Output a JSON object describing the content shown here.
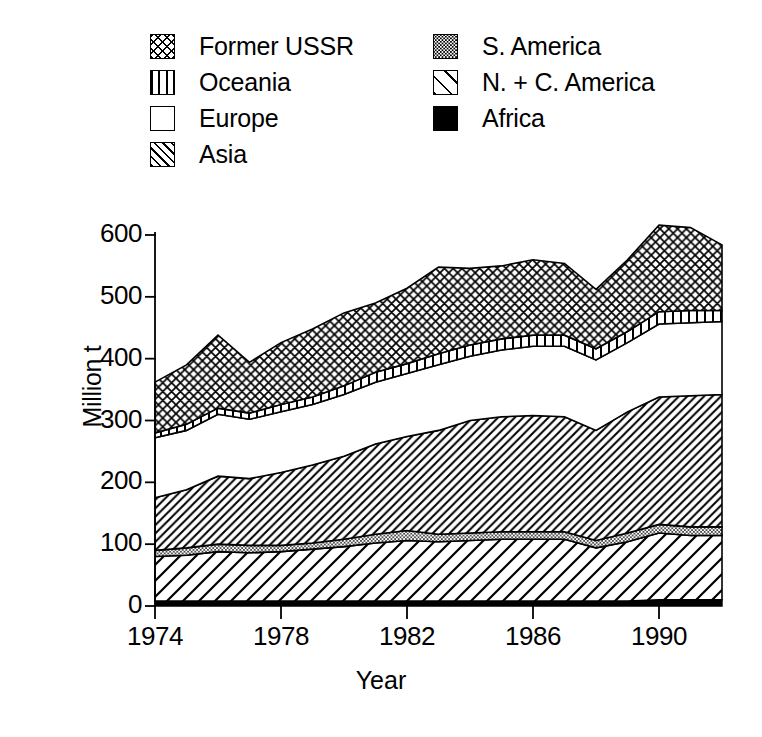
{
  "chart_data": {
    "type": "area",
    "title": "",
    "xlabel": "Year",
    "ylabel": "Million t",
    "xlim": [
      1974,
      1992
    ],
    "ylim": [
      0,
      640
    ],
    "yticks": [
      0,
      100,
      200,
      300,
      400,
      500,
      600
    ],
    "xticks": [
      1974,
      1978,
      1982,
      1986,
      1990
    ],
    "grid": false,
    "stacked": true,
    "legend_position": "top",
    "x": [
      1974,
      1975,
      1976,
      1977,
      1978,
      1979,
      1980,
      1981,
      1982,
      1983,
      1984,
      1985,
      1986,
      1987,
      1988,
      1989,
      1990,
      1991,
      1992
    ],
    "stack_order_bottom_to_top": [
      "Africa",
      "N. + C. America",
      "S. America",
      "Asia",
      "Europe",
      "Oceania",
      "Former USSR"
    ],
    "series": [
      {
        "name": "Africa",
        "pattern": "solid-black",
        "values": [
          8,
          8,
          8,
          8,
          8,
          8,
          8,
          8,
          8,
          8,
          8,
          8,
          8,
          8,
          8,
          8,
          10,
          10,
          10
        ]
      },
      {
        "name": "N. + C. America",
        "pattern": "wide-diagonal-hatch",
        "values": [
          72,
          74,
          80,
          78,
          80,
          84,
          88,
          94,
          98,
          96,
          98,
          100,
          100,
          100,
          86,
          96,
          108,
          104,
          104
        ]
      },
      {
        "name": "S. America",
        "pattern": "fine-dots",
        "values": [
          10,
          12,
          12,
          12,
          10,
          10,
          12,
          14,
          16,
          12,
          12,
          12,
          12,
          12,
          12,
          14,
          14,
          14,
          14
        ]
      },
      {
        "name": "Asia",
        "pattern": "narrow-diagonal-hatch",
        "values": [
          85,
          94,
          110,
          108,
          118,
          126,
          134,
          146,
          152,
          168,
          182,
          186,
          188,
          186,
          178,
          196,
          206,
          212,
          214
        ]
      },
      {
        "name": "Europe",
        "pattern": "white",
        "values": [
          97,
          96,
          100,
          96,
          98,
          98,
          100,
          100,
          102,
          106,
          104,
          108,
          112,
          114,
          114,
          112,
          118,
          118,
          118
        ]
      },
      {
        "name": "Oceania",
        "pattern": "vertical-bars",
        "values": [
          8,
          10,
          10,
          10,
          12,
          12,
          14,
          16,
          16,
          18,
          18,
          18,
          18,
          18,
          18,
          18,
          20,
          20,
          18
        ]
      },
      {
        "name": "Former USSR",
        "pattern": "cross-hatch",
        "values": [
          82,
          96,
          118,
          82,
          100,
          110,
          118,
          112,
          122,
          140,
          124,
          118,
          122,
          116,
          96,
          116,
          140,
          134,
          106
        ]
      }
    ],
    "totals": [
      362,
      390,
      438,
      294,
      426,
      448,
      474,
      482,
      514,
      550,
      546,
      542,
      560,
      546,
      512,
      552,
      616,
      612,
      584
    ],
    "cumulative_tops": {
      "Africa": [
        8,
        8,
        8,
        8,
        8,
        8,
        8,
        8,
        8,
        8,
        8,
        8,
        8,
        8,
        8,
        8,
        10,
        10,
        10
      ],
      "N. + C. America": [
        80,
        82,
        88,
        86,
        88,
        92,
        96,
        102,
        106,
        104,
        106,
        108,
        108,
        108,
        94,
        104,
        118,
        114,
        114
      ],
      "S. America": [
        90,
        94,
        100,
        98,
        98,
        102,
        108,
        116,
        122,
        116,
        118,
        120,
        120,
        120,
        106,
        118,
        132,
        128,
        128
      ],
      "Asia": [
        175,
        188,
        210,
        206,
        216,
        228,
        242,
        262,
        274,
        284,
        300,
        306,
        308,
        306,
        284,
        314,
        338,
        340,
        342
      ],
      "Europe": [
        272,
        284,
        310,
        302,
        314,
        326,
        342,
        362,
        376,
        390,
        404,
        414,
        420,
        420,
        398,
        426,
        456,
        458,
        460
      ],
      "Oceania": [
        280,
        294,
        320,
        312,
        326,
        338,
        356,
        378,
        392,
        408,
        422,
        432,
        438,
        438,
        416,
        444,
        476,
        478,
        478
      ],
      "Former USSR": [
        362,
        390,
        438,
        394,
        426,
        448,
        474,
        490,
        514,
        548,
        546,
        550,
        560,
        554,
        512,
        560,
        616,
        612,
        584
      ]
    }
  },
  "legend": {
    "columns": [
      {
        "items": [
          {
            "label": "Former USSR",
            "pattern": "cross-hatch",
            "icon": "swatch-cross-hatch-icon"
          },
          {
            "label": "Oceania",
            "pattern": "vertical-bars",
            "icon": "swatch-vertical-bars-icon"
          },
          {
            "label": "Europe",
            "pattern": "white",
            "icon": "swatch-white-icon"
          },
          {
            "label": "Asia",
            "pattern": "narrow-diagonal-hatch",
            "icon": "swatch-diagonal-hatch-icon"
          }
        ]
      },
      {
        "items": [
          {
            "label": "S. America",
            "pattern": "fine-dots",
            "icon": "swatch-dots-icon"
          },
          {
            "label": "N. + C. America",
            "pattern": "wide-diagonal-hatch",
            "icon": "swatch-wide-diagonal-icon"
          },
          {
            "label": "Africa",
            "pattern": "solid-black",
            "icon": "swatch-solid-black-icon"
          }
        ]
      }
    ]
  },
  "axes": {
    "y_label": "Million t",
    "x_label": "Year",
    "y_tick_labels": [
      "600",
      "500",
      "400",
      "300",
      "200",
      "100",
      "0"
    ],
    "x_tick_labels": [
      "1974",
      "1978",
      "1982",
      "1986",
      "1990"
    ]
  },
  "colors": {
    "foreground": "#000000",
    "background": "#ffffff"
  }
}
